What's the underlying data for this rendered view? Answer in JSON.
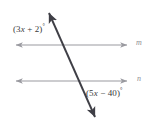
{
  "figure": {
    "background_color": "#ffffff",
    "width": 155,
    "height": 131
  },
  "colors": {
    "parallel_line": "#9a9aa0",
    "transversal_line": "#3f3f46",
    "angle_text": "#3a3a3a",
    "line_label_text": "#8d8d93"
  },
  "labels": {
    "top_angle": {
      "open_paren": "(",
      "coefficient": "3",
      "variable": "x",
      "operator": "+",
      "constant": "2",
      "close_paren": ")",
      "degree": "°",
      "full_text": "(3x + 2)°"
    },
    "bottom_angle": {
      "open_paren": "(",
      "coefficient": "5",
      "variable": "x",
      "operator": "−",
      "constant": "40",
      "close_paren": ")",
      "degree": "°",
      "full_text": "(5x − 40)°"
    },
    "line_m": "m",
    "line_n": "n"
  },
  "geometry": {
    "line_m": {
      "name": "m",
      "type": "double-headed-arrow",
      "x1": 12,
      "y1": 45,
      "x2": 131,
      "y2": 45
    },
    "line_n": {
      "name": "n",
      "type": "double-headed-arrow",
      "x1": 12,
      "y1": 81,
      "x2": 131,
      "y2": 81
    },
    "transversal": {
      "name": "transversal",
      "type": "double-headed-arrow",
      "x1": 47,
      "y1": 8,
      "x2": 97,
      "y2": 122
    },
    "intersections": [
      {
        "label": "transversal-meets-m",
        "x": 63,
        "y": 45
      },
      {
        "label": "transversal-meets-n",
        "x": 82,
        "y": 81
      }
    ]
  }
}
